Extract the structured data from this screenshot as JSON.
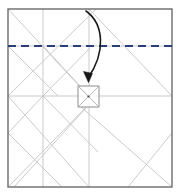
{
  "figure": {
    "type": "crease-pattern-diagram",
    "canvas": {
      "width": 179,
      "height": 194
    },
    "background_color": "#ffffff"
  },
  "colors": {
    "paper_border": "#6b6b6b",
    "crease_line": "#b9b9b9",
    "crease_line_light": "#cfcfcf",
    "fold_line_blue": "#2a3f77",
    "arrow_black": "#1a1a1a",
    "center_square_border": "#8d8d8d"
  },
  "paper": {
    "label": "square paper sheet",
    "left": 8,
    "top": 9,
    "right": 172,
    "bottom": 187,
    "stroke_width": 1.4
  },
  "grid": {
    "vertical_lines": [
      {
        "name": "vertical-quarter-left",
        "x": 43,
        "y1": 9,
        "y2": 187
      },
      {
        "name": "vertical-center",
        "x": 89,
        "y1": 9,
        "y2": 187
      }
    ],
    "horizontal_lines": [
      {
        "name": "horizontal-center",
        "y": 96,
        "x1": 8,
        "x2": 172
      },
      {
        "name": "horizontal-upper",
        "y": 46,
        "x1": 8,
        "x2": 172
      }
    ]
  },
  "diagonals": [
    {
      "name": "diag-tl-to-center",
      "x1": 8,
      "y1": 9,
      "x2": 89,
      "y2": 96
    },
    {
      "name": "diag-tl-corner-to-bottom",
      "x1": 8,
      "y1": 9,
      "x2": 96,
      "y2": 104
    },
    {
      "name": "diag-top-center-to-right",
      "x1": 89,
      "y1": 9,
      "x2": 172,
      "y2": 96
    },
    {
      "name": "diag-upperleft-down-right",
      "x1": 43,
      "y1": 46,
      "x2": 96,
      "y2": 104
    },
    {
      "name": "diag-left-mid-up-right",
      "x1": 8,
      "y1": 96,
      "x2": 96,
      "y2": 9
    },
    {
      "name": "diag-left-to-upper-node",
      "x1": 8,
      "y1": 46,
      "x2": 60,
      "y2": 96
    },
    {
      "name": "diag-center-left-fan-up",
      "x1": 43,
      "y1": 96,
      "x2": 89,
      "y2": 48
    },
    {
      "name": "diag-bl-to-center",
      "x1": 8,
      "y1": 187,
      "x2": 96,
      "y2": 96
    },
    {
      "name": "diag-bl-up-right",
      "x1": 8,
      "y1": 187,
      "x2": 89,
      "y2": 104
    },
    {
      "name": "diag-center-to-br",
      "x1": 82,
      "y1": 104,
      "x2": 172,
      "y2": 187
    },
    {
      "name": "diag-left-mid-down-right",
      "x1": 8,
      "y1": 96,
      "x2": 89,
      "y2": 187
    },
    {
      "name": "diag-quarter-down-left",
      "x1": 43,
      "y1": 96,
      "x2": 8,
      "y2": 133
    },
    {
      "name": "diag-quarter-down-right",
      "x1": 43,
      "y1": 96,
      "x2": 96,
      "y2": 150
    },
    {
      "name": "diag-left-low-to-bottom",
      "x1": 8,
      "y1": 133,
      "x2": 60,
      "y2": 187
    },
    {
      "name": "diag-center-low-to-bottom-left",
      "x1": 89,
      "y1": 110,
      "x2": 14,
      "y2": 187
    },
    {
      "name": "diag-bottomright-up",
      "x1": 172,
      "y1": 133,
      "x2": 128,
      "y2": 187
    }
  ],
  "center_square": {
    "name": "center-square",
    "left": 78,
    "top": 86,
    "size": 21,
    "has_diagonals": true,
    "center_dot": {
      "x": 88.5,
      "y": 96.5,
      "r": 1.1
    }
  },
  "fold_line": {
    "name": "blue-dashed-fold-line",
    "style": "dashed",
    "y": 46,
    "x1": 8,
    "x2": 172,
    "dash": "8 5",
    "stroke_width": 2.1
  },
  "fold_arrow": {
    "name": "fold-arrow",
    "description": "curved arrow showing the top edge folding down to the center square",
    "path": "M 86 11 C 104 24, 106 52, 88 78",
    "stroke_width": 1.6,
    "head": {
      "x": 88,
      "y": 81,
      "angle_deg": 58,
      "size": 8
    }
  }
}
